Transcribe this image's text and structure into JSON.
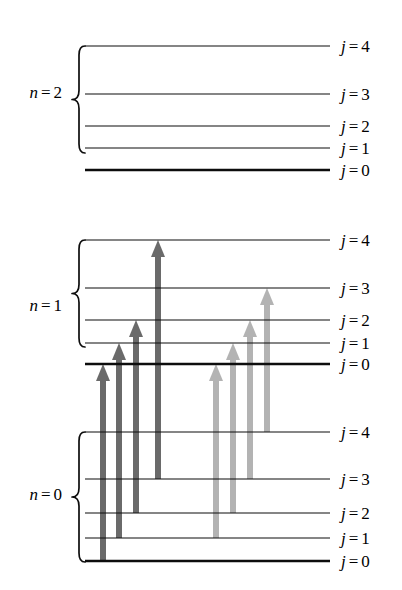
{
  "figure": {
    "type": "energy-level-diagram",
    "title": "",
    "background": "#ffffff",
    "line_color": "#0d0d0d",
    "geometry": {
      "level_x_start": 85,
      "level_x_end": 330,
      "label_x": 341,
      "brace_x": 72
    }
  },
  "manifolds": [
    {
      "id": "n2",
      "name_prefix": "n",
      "name_eq": "=",
      "name_value": "2",
      "label": "n = 2",
      "label_y": 92,
      "brace": {
        "top": 46,
        "bottom": 153
      },
      "levels": [
        {
          "j": "4",
          "label_j": "j",
          "label_eq": "=",
          "label_val": "4",
          "label": "j = 4",
          "y": 46,
          "thick": false
        },
        {
          "j": "3",
          "label_j": "j",
          "label_eq": "=",
          "label_val": "3",
          "label": "j = 3",
          "y": 94,
          "thick": false
        },
        {
          "j": "2",
          "label_j": "j",
          "label_eq": "=",
          "label_val": "2",
          "label": "j = 2",
          "y": 126,
          "thick": false
        },
        {
          "j": "1",
          "label_j": "j",
          "label_eq": "=",
          "label_val": "1",
          "label": "j = 1",
          "y": 148,
          "thick": false
        },
        {
          "j": "0",
          "label_j": "j",
          "label_eq": "=",
          "label_val": "0",
          "label": "j = 0",
          "y": 170,
          "thick": true
        }
      ]
    },
    {
      "id": "n1",
      "name_prefix": "n",
      "name_eq": "=",
      "name_value": "1",
      "label": "n = 1",
      "label_y": 305,
      "brace": {
        "top": 240,
        "bottom": 347
      },
      "levels": [
        {
          "j": "4",
          "label_j": "j",
          "label_eq": "=",
          "label_val": "4",
          "label": "j = 4",
          "y": 240,
          "thick": false
        },
        {
          "j": "3",
          "label_j": "j",
          "label_eq": "=",
          "label_val": "3",
          "label": "j = 3",
          "y": 288,
          "thick": false
        },
        {
          "j": "2",
          "label_j": "j",
          "label_eq": "=",
          "label_val": "2",
          "label": "j = 2",
          "y": 320,
          "thick": false
        },
        {
          "j": "1",
          "label_j": "j",
          "label_eq": "=",
          "label_val": "1",
          "label": "j = 1",
          "y": 343,
          "thick": false
        },
        {
          "j": "0",
          "label_j": "j",
          "label_eq": "=",
          "label_val": "0",
          "label": "j = 0",
          "y": 364,
          "thick": true
        }
      ]
    },
    {
      "id": "n0",
      "name_prefix": "n",
      "name_eq": "=",
      "name_value": "0",
      "label": "n = 0",
      "label_y": 494,
      "brace": {
        "top": 432,
        "bottom": 562
      },
      "levels": [
        {
          "j": "4",
          "label_j": "j",
          "label_eq": "=",
          "label_val": "4",
          "label": "j = 4",
          "y": 432,
          "thick": false
        },
        {
          "j": "3",
          "label_j": "j",
          "label_eq": "=",
          "label_val": "3",
          "label": "j = 3",
          "y": 479,
          "thick": false
        },
        {
          "j": "2",
          "label_j": "j",
          "label_eq": "=",
          "label_val": "2",
          "label": "j = 2",
          "y": 513,
          "thick": false
        },
        {
          "j": "1",
          "label_j": "j",
          "label_eq": "=",
          "label_val": "1",
          "label": "j = 1",
          "y": 538,
          "thick": false
        },
        {
          "j": "0",
          "label_j": "j",
          "label_eq": "=",
          "label_val": "0",
          "label": "j = 0",
          "y": 561,
          "thick": true
        }
      ]
    }
  ],
  "arrows": {
    "colors": {
      "dark": "#6a6a6a",
      "light": "#b3b3b3"
    },
    "shaft_width": 6,
    "head_width": 14,
    "head_height": 17,
    "items": [
      {
        "id": "d1",
        "branch": "dark",
        "color": "#6a6a6a",
        "x": 103,
        "from_manifold": "n0",
        "from_j": "0",
        "to_manifold": "n1",
        "to_j": "0",
        "y_start": 561,
        "y_end": 364
      },
      {
        "id": "d2",
        "branch": "dark",
        "color": "#6a6a6a",
        "x": 119,
        "from_manifold": "n0",
        "from_j": "1",
        "to_manifold": "n1",
        "to_j": "1",
        "y_start": 538,
        "y_end": 343
      },
      {
        "id": "d3",
        "branch": "dark",
        "color": "#6a6a6a",
        "x": 136,
        "from_manifold": "n0",
        "from_j": "2",
        "to_manifold": "n1",
        "to_j": "2",
        "y_start": 513,
        "y_end": 320
      },
      {
        "id": "d4",
        "branch": "dark",
        "color": "#6a6a6a",
        "x": 158,
        "from_manifold": "n0",
        "from_j": "3",
        "to_manifold": "n1",
        "to_j": "4",
        "y_start": 479,
        "y_end": 240
      },
      {
        "id": "l1",
        "branch": "light",
        "color": "#b3b3b3",
        "x": 216,
        "from_manifold": "n0",
        "from_j": "1",
        "to_manifold": "n1",
        "to_j": "0",
        "y_start": 538,
        "y_end": 364
      },
      {
        "id": "l2",
        "branch": "light",
        "color": "#b3b3b3",
        "x": 233,
        "from_manifold": "n0",
        "from_j": "2",
        "to_manifold": "n1",
        "to_j": "1",
        "y_start": 513,
        "y_end": 343
      },
      {
        "id": "l3",
        "branch": "light",
        "color": "#b3b3b3",
        "x": 250,
        "from_manifold": "n0",
        "from_j": "3",
        "to_manifold": "n1",
        "to_j": "2",
        "y_start": 479,
        "y_end": 320
      },
      {
        "id": "l4",
        "branch": "light",
        "color": "#b3b3b3",
        "x": 267,
        "from_manifold": "n0",
        "from_j": "4",
        "to_manifold": "n1",
        "to_j": "3",
        "y_start": 432,
        "y_end": 288
      }
    ]
  }
}
